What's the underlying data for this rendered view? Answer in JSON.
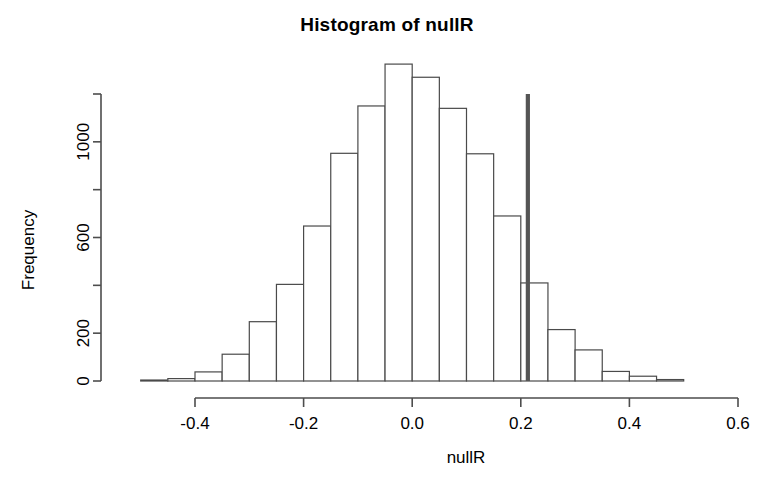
{
  "chart_data": {
    "type": "bar",
    "title": "Histogram of nullR",
    "xlabel": "nullR",
    "ylabel": "Frequency",
    "grid": false,
    "legend": "none",
    "xlim": [
      -0.525,
      0.625
    ],
    "ylim": [
      0,
      1380
    ],
    "bin_width": 0.05,
    "x_ticks": [
      "-0.4",
      "-0.2",
      "0.0",
      "0.2",
      "0.4",
      "0.6"
    ],
    "x_tick_values": [
      -0.4,
      -0.2,
      0.0,
      0.2,
      0.4,
      0.6
    ],
    "y_ticks": [
      "0",
      "200",
      "600",
      "1000"
    ],
    "y_tick_values": [
      0,
      200,
      600,
      1000
    ],
    "y_tick_values_all": [
      0,
      200,
      400,
      600,
      800,
      1000,
      1200
    ],
    "bin_starts": [
      -0.5,
      -0.45,
      -0.4,
      -0.35,
      -0.3,
      -0.25,
      -0.2,
      -0.15,
      -0.1,
      -0.05,
      0.0,
      0.05,
      0.1,
      0.15,
      0.2,
      0.25,
      0.3,
      0.35,
      0.4,
      0.45
    ],
    "bin_ends": [
      -0.45,
      -0.4,
      -0.35,
      -0.3,
      -0.25,
      -0.2,
      -0.15,
      -0.1,
      -0.05,
      0.0,
      0.05,
      0.1,
      0.15,
      0.2,
      0.25,
      0.3,
      0.35,
      0.4,
      0.45,
      0.5
    ],
    "categories": [
      "-0.50",
      "-0.45",
      "-0.40",
      "-0.35",
      "-0.30",
      "-0.25",
      "-0.20",
      "-0.15",
      "-0.10",
      "-0.05",
      "0.00",
      "0.05",
      "0.10",
      "0.15",
      "0.20",
      "0.25",
      "0.30",
      "0.35",
      "0.40",
      "0.45"
    ],
    "values": [
      4,
      10,
      38,
      112,
      248,
      404,
      648,
      952,
      1150,
      1325,
      1270,
      1140,
      950,
      690,
      410,
      215,
      130,
      40,
      20,
      6
    ],
    "annotations": [
      {
        "name": "observed-value-line",
        "type": "vline",
        "x": 0.213,
        "y_top": 1200,
        "color": "#555555"
      }
    ]
  },
  "plot_geometry": {
    "x_axis_pixel_left": 195,
    "x_axis_pixel_right": 738,
    "y_axis_pixel_zero": 381,
    "y_axis_pixel_top": 94
  }
}
